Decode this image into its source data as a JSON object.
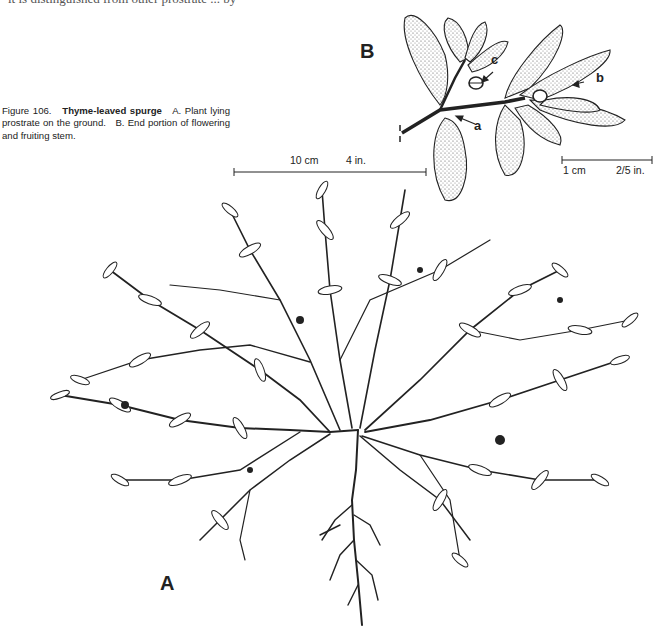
{
  "page": {
    "cutoff_top_text": "it is distinguished from other prostrate ... by",
    "cutoff_top_right": "...."
  },
  "caption": {
    "figure_number": "Figure 106.",
    "title": "Thyme-leaved spurge",
    "text_a": "A. Plant lying prostrate on the ground.",
    "text_b": "B. End portion of flowering and fruiting stem."
  },
  "panels": {
    "a_label": "A",
    "b_label": "B"
  },
  "scale_bars": {
    "large": {
      "metric": "10 cm",
      "imperial": "4 in."
    },
    "small": {
      "metric": "1 cm",
      "imperial": "2/5 in."
    }
  },
  "callouts": {
    "a": "a",
    "b": "b",
    "c": "c"
  },
  "colors": {
    "ink": "#1a1a1a",
    "paper": "#ffffff"
  }
}
